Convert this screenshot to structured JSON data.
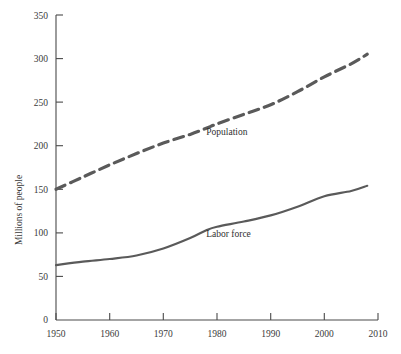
{
  "chart_data": {
    "type": "line",
    "title": "",
    "xlabel": "",
    "ylabel": "Millions of people",
    "xlim": [
      1950,
      2010
    ],
    "ylim": [
      0,
      350
    ],
    "xticks": [
      1950,
      1960,
      1970,
      1980,
      1990,
      2000,
      2010
    ],
    "yticks": [
      0,
      50,
      100,
      150,
      200,
      250,
      300,
      350
    ],
    "grid": false,
    "legend_position": "inline-annotation",
    "x": [
      1950,
      1955,
      1960,
      1965,
      1970,
      1975,
      1978,
      1980,
      1985,
      1990,
      1995,
      2000,
      2005,
      2008
    ],
    "series": [
      {
        "name": "Population",
        "label": "Population",
        "style": "dashed",
        "color": "#5a5a5a",
        "values": [
          150,
          164,
          178,
          191,
          203,
          213,
          220,
          225,
          236,
          247,
          262,
          279,
          294,
          305
        ]
      },
      {
        "name": "Labor force",
        "label": "Labor force",
        "style": "solid",
        "color": "#5a5a5a",
        "values": [
          63,
          67,
          70,
          74,
          82,
          94,
          103,
          107,
          113,
          120,
          130,
          142,
          148,
          154
        ]
      }
    ],
    "annotations": [
      {
        "text": "Population",
        "x": 1978,
        "y": 212
      },
      {
        "text": "Labor force",
        "x": 1978,
        "y": 95
      }
    ]
  },
  "axis": {
    "y_labels": [
      "350",
      "300",
      "250",
      "200",
      "150",
      "100",
      "50",
      "0"
    ],
    "x_labels": [
      "1950",
      "1960",
      "1970",
      "1980",
      "1990",
      "2000",
      "2010"
    ],
    "y_title": "Millions of people"
  },
  "labels": {
    "population": "Population",
    "labor_force": "Labor force"
  },
  "colors": {
    "line": "#5a5a5a",
    "axis": "#4a4a4a",
    "text": "#3a3a3a",
    "background": "#ffffff"
  }
}
